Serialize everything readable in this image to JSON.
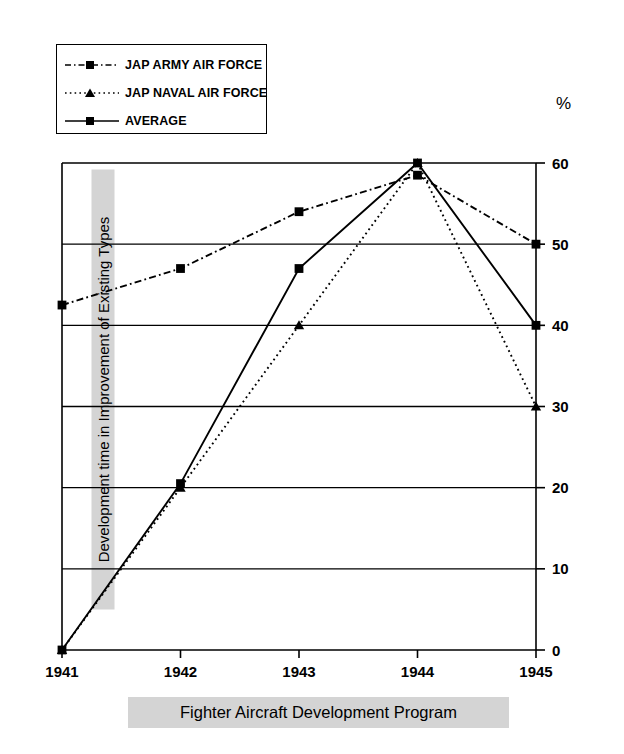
{
  "chart_data": {
    "type": "line",
    "title": "Fighter Aircraft Development Program",
    "xlabel": "",
    "ylabel": "Development time in Improvement of Existing Types",
    "unit_label": "%",
    "categories": [
      "1941",
      "1942",
      "1943",
      "1944",
      "1945"
    ],
    "ylim": [
      0,
      60
    ],
    "yticks": [
      0,
      10,
      20,
      30,
      40,
      50,
      60
    ],
    "grid": true,
    "y_axis_position": "right",
    "legend_position": "top-left",
    "series": [
      {
        "name": "JAP ARMY AIR FORCE",
        "values": [
          42.5,
          47,
          54,
          58.5,
          50
        ],
        "line_style": "dash-dot",
        "marker": "square",
        "color": "#000000"
      },
      {
        "name": "JAP NAVAL AIR FORCE",
        "values": [
          0,
          20,
          40,
          60,
          30
        ],
        "line_style": "dotted",
        "marker": "triangle",
        "color": "#000000"
      },
      {
        "name": "AVERAGE",
        "values": [
          0,
          20.5,
          47,
          60,
          40
        ],
        "line_style": "solid",
        "marker": "square",
        "color": "#000000"
      }
    ]
  },
  "legend": {
    "items": [
      {
        "label": "JAP ARMY AIR FORCE"
      },
      {
        "label": "JAP NAVAL AIR FORCE"
      },
      {
        "label": "AVERAGE"
      }
    ]
  },
  "axis": {
    "unit": "%",
    "y_ticks": [
      "60",
      "50",
      "40",
      "30",
      "20",
      "10",
      "0"
    ],
    "x_ticks": [
      "1941",
      "1942",
      "1943",
      "1944",
      "1945"
    ]
  },
  "labels": {
    "y_title": "Development time in Improvement of Existing Types",
    "chart_title": "Fighter Aircraft Development Program"
  }
}
